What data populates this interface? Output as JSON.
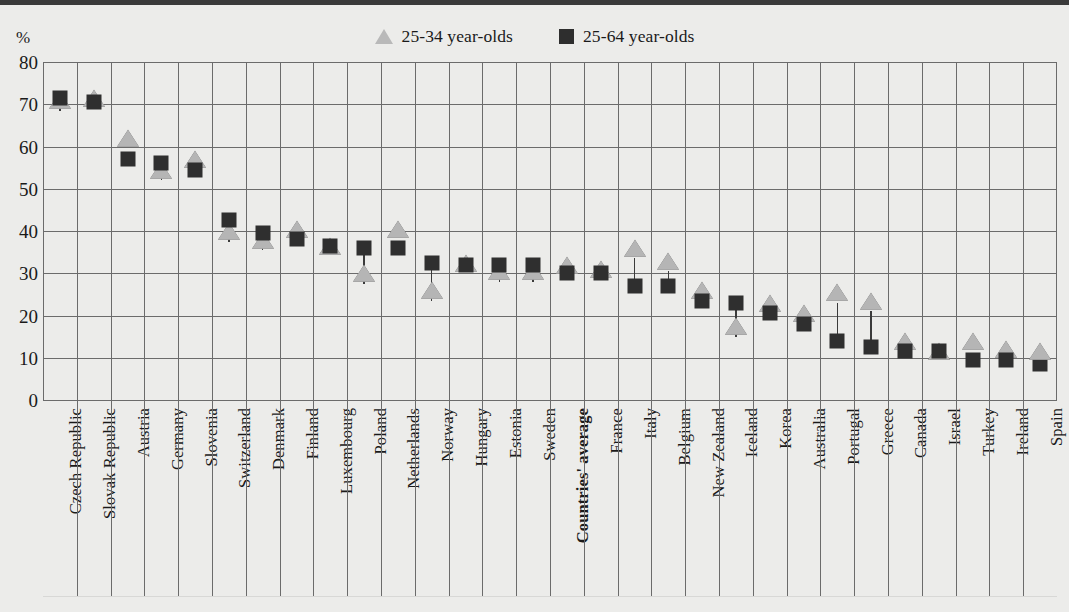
{
  "chart_data": {
    "type": "scatter",
    "title": "",
    "subtitle": "",
    "xlabel": "",
    "ylabel": "%",
    "ylim": [
      0,
      80
    ],
    "yticks": [
      0,
      10,
      20,
      30,
      40,
      50,
      60,
      70,
      80
    ],
    "grid": true,
    "legend_position": "top-center",
    "legend": [
      "25-34 year-olds",
      "25-64 year-olds"
    ],
    "categories": [
      "Czech Republic",
      "Slovak Republic",
      "Austria",
      "Germany",
      "Slovenia",
      "Switzerland",
      "Denmark",
      "Finland",
      "Luxembourg",
      "Poland",
      "Netherlands",
      "Norway",
      "Hungary",
      "Estonia",
      "Sweden",
      "Countries' average",
      "France",
      "Italy",
      "Belgium",
      "New Zealand",
      "Iceland",
      "Korea",
      "Australia",
      "Portugal",
      "Greece",
      "Canada",
      "Israel",
      "Turkey",
      "Ireland",
      "Spain"
    ],
    "highlight_category": "Countries' average",
    "series": [
      {
        "name": "25-34 year-olds",
        "marker": "triangle",
        "color": "#b5b5b5",
        "values": [
          68.5,
          69.0,
          59.5,
          52.0,
          54.5,
          37.5,
          35.5,
          38.0,
          34.0,
          27.5,
          38.0,
          23.5,
          30.0,
          28.0,
          28.0,
          29.5,
          28.5,
          33.5,
          30.5,
          23.5,
          15.0,
          20.5,
          18.0,
          23.0,
          21.0,
          11.5,
          9.0,
          11.5,
          9.5,
          9.0
        ]
      },
      {
        "name": "25-64 year-olds",
        "marker": "square",
        "color": "#2f2f2f",
        "values": [
          71.5,
          70.5,
          57.0,
          56.0,
          54.5,
          42.5,
          39.5,
          38.0,
          36.5,
          36.0,
          36.0,
          32.5,
          32.0,
          32.0,
          32.0,
          30.0,
          30.0,
          27.0,
          27.0,
          23.5,
          23.0,
          20.5,
          18.0,
          14.0,
          12.5,
          11.5,
          11.5,
          9.5,
          9.5,
          8.5
        ]
      }
    ]
  }
}
